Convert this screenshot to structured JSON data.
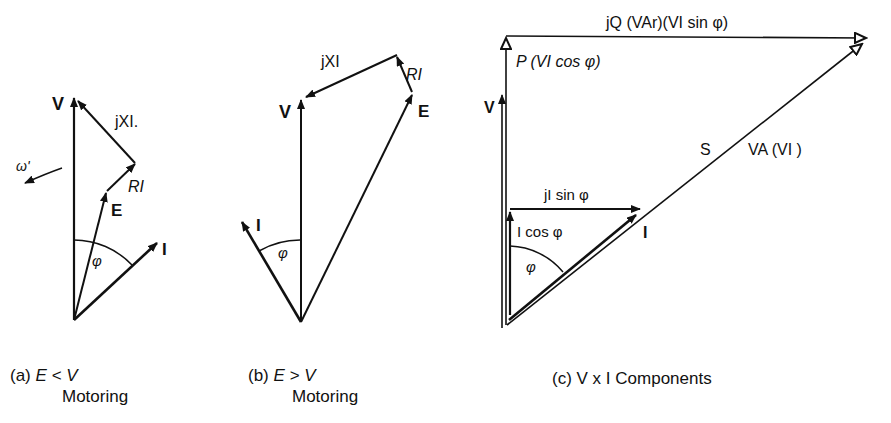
{
  "diagram_a": {
    "labels": {
      "V": "V",
      "jXI": "jXI.",
      "RI": "RI",
      "E": "E",
      "I": "I",
      "phi": "φ",
      "omega": "ω'"
    },
    "caption_prefix": "(a)",
    "caption_condition": "E < V",
    "caption_mode": "Motoring"
  },
  "diagram_b": {
    "labels": {
      "V": "V",
      "jXI": "jXI",
      "RI": "RI",
      "E": "E",
      "I": "I",
      "phi": "φ"
    },
    "caption_prefix": "(b)",
    "caption_condition": "E > V",
    "caption_mode": "Motoring"
  },
  "diagram_c": {
    "labels": {
      "jQ": "jQ (VAr)(VI sin φ)",
      "P": "P (VI cos φ)",
      "V": "V",
      "S": "S",
      "VA": "VA (VI )",
      "jIsin": "jI sin φ",
      "Icos": "I cos φ",
      "I": "I",
      "phi": "φ"
    },
    "caption_prefix": "(c)",
    "caption_text": "V x I Components"
  },
  "colors": {
    "ink": "#111111",
    "background": "#ffffff"
  }
}
